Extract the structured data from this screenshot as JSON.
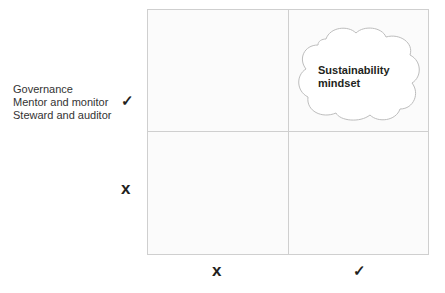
{
  "diagram": {
    "y_axis": {
      "label_lines": [
        "Governance",
        "Mentor and monitor",
        "Steward and auditor"
      ],
      "high_mark": "✓",
      "low_mark": "x"
    },
    "x_axis": {
      "low_mark": "x",
      "high_mark": "✓"
    },
    "quadrants": {
      "top_right": {
        "label": "Sustainability mindset",
        "label_lines": [
          "Sustainability",
          "mindset"
        ],
        "shape": "cloud"
      },
      "top_left": {
        "label": ""
      },
      "bottom_left": {
        "label": ""
      },
      "bottom_right": {
        "label": ""
      }
    },
    "colors": {
      "grid_line": "#cfcfcf",
      "text": "#231f20",
      "cloud_stroke": "#bdbdbd"
    }
  }
}
